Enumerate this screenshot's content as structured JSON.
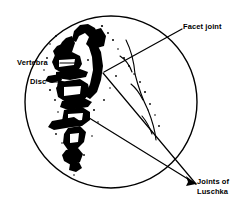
{
  "figure": {
    "type": "anatomical-illustration",
    "background_color": "#ffffff",
    "ink_color": "#000000",
    "frame": {
      "shape": "circle",
      "center_x": 111,
      "center_y": 102,
      "radius": 86,
      "stroke_width": 1.4
    },
    "labels": {
      "vertebra": {
        "text": "Vertebra",
        "leader": "dash"
      },
      "disc": {
        "text": "Disc",
        "leader": "arrow"
      },
      "facet_joint": {
        "text": "Facet joint",
        "leader": "line"
      },
      "joints_of_luschka": {
        "line1": "Joints of",
        "line2": "Luschka",
        "leader": "double-line-arrow"
      }
    }
  }
}
